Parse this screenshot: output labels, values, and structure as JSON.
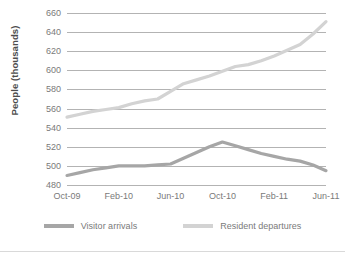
{
  "chart_data": {
    "type": "line",
    "title": "",
    "xlabel": "",
    "ylabel": "People (thousands)",
    "ylim": [
      480,
      660
    ],
    "ytick_step": 20,
    "yticks": [
      660,
      640,
      620,
      600,
      580,
      560,
      540,
      520,
      500,
      480
    ],
    "grid": true,
    "legend_position": "bottom",
    "x": [
      "Oct-09",
      "Nov-09",
      "Dec-09",
      "Jan-10",
      "Feb-10",
      "Mar-10",
      "Apr-10",
      "May-10",
      "Jun-10",
      "Jul-10",
      "Aug-10",
      "Sep-10",
      "Oct-10",
      "Nov-10",
      "Dec-10",
      "Jan-11",
      "Feb-11",
      "Mar-11",
      "Apr-11",
      "May-11",
      "Jun-11"
    ],
    "xtick_labels": [
      "Oct-09",
      "Feb-10",
      "Jun-10",
      "Oct-10",
      "Feb-11",
      "Jun-11"
    ],
    "xtick_indices": [
      0,
      4,
      8,
      12,
      16,
      20
    ],
    "series": [
      {
        "name": "Visitor arrivals",
        "color": "#a6a6a6",
        "values": [
          490,
          493,
          496,
          498,
          500,
          500,
          500,
          501,
          502,
          508,
          514,
          520,
          525,
          521,
          517,
          513,
          510,
          507,
          505,
          501,
          495
        ]
      },
      {
        "name": "Resident departures",
        "color": "#d3d3d3",
        "values": [
          551,
          554,
          557,
          559,
          561,
          565,
          568,
          570,
          578,
          586,
          590,
          594,
          599,
          604,
          606,
          610,
          615,
          621,
          627,
          638,
          651
        ]
      }
    ]
  },
  "legend": {
    "items": [
      {
        "label": "Visitor arrivals",
        "color": "#a6a6a6"
      },
      {
        "label": "Resident departures",
        "color": "#d3d3d3"
      }
    ]
  }
}
